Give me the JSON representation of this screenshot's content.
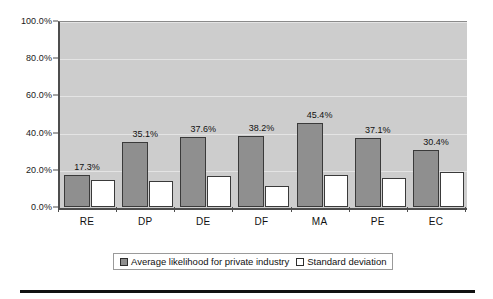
{
  "chart_data": {
    "type": "bar",
    "title": "",
    "subtitle": "",
    "xlabel": "",
    "ylabel": "",
    "ylim": [
      0,
      100
    ],
    "yticks": [
      "0.0%",
      "20.0%",
      "40.0%",
      "60.0%",
      "80.0%",
      "100.0%"
    ],
    "ytick_values": [
      0,
      20,
      40,
      60,
      80,
      100
    ],
    "grid": true,
    "grid_axis": "y",
    "legend_position": "bottom",
    "categories": [
      "RE",
      "DP",
      "DE",
      "DF",
      "MA",
      "PE",
      "EC"
    ],
    "series": [
      {
        "name": "Average likelihood for private industry",
        "values": [
          17.3,
          35.1,
          37.6,
          38.2,
          45.4,
          37.1,
          30.4
        ],
        "value_labels": [
          "17.3%",
          "35.1%",
          "37.6%",
          "38.2%",
          "45.4%",
          "37.1%",
          "30.4%"
        ],
        "color": "#8f8f8f",
        "labels_shown": true
      },
      {
        "name": "Standard deviation",
        "values": [
          14.3,
          13.9,
          16.8,
          11.1,
          17.2,
          15.4,
          18.8
        ],
        "value_labels": [
          "",
          "",
          "",
          "",
          "",
          "",
          ""
        ],
        "color": "#ffffff",
        "labels_shown": false
      }
    ],
    "plot_background": "#cdcdcd",
    "axis_color": "#4d4d4d"
  },
  "legend": {
    "entries": [
      {
        "label": "Average likelihood for private industry",
        "swatch": "primary"
      },
      {
        "label": "Standard deviation",
        "swatch": "secondary"
      }
    ]
  }
}
